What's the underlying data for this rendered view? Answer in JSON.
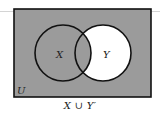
{
  "diagram": {
    "type": "venn",
    "universe_label": "U",
    "sets": [
      {
        "label": "X",
        "shaded": true
      },
      {
        "label": "Y",
        "shaded_outside_X": false
      }
    ],
    "intersection_shaded": true,
    "outside_shaded": true,
    "caption": "X ∪ Y′",
    "colors": {
      "shade": "#9b9b9b",
      "unshaded": "#ffffff",
      "stroke": "#111111"
    }
  }
}
